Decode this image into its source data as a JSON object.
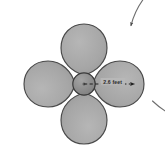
{
  "measurement": {
    "radius_label": "2.6 feet",
    "value": 2.6,
    "unit": "feet",
    "measured_from": "hub center",
    "measured_to": "blade tip"
  },
  "rotation": {
    "direction": "clockwise",
    "arc_arrow_name": "rotation-arc-arrow"
  },
  "geometry": {
    "center_x": 84,
    "center_y": 84,
    "hub_radius": 11,
    "blade_tip_radius": 52,
    "outer_arc_radius": 78,
    "blade_count": 4,
    "blade_angles_deg": [
      0,
      90,
      180,
      270
    ]
  },
  "colors": {
    "background": "#ffffff",
    "blade_fill": "#a8a8a8",
    "blade_stroke": "#4a4a4a",
    "hub_fill": "#8e8e8e",
    "hub_stroke": "#3a3a3a",
    "arc_stroke": "#6a6a6a",
    "dashed_line": "#1f1f1f",
    "label_text": "#2b2b2b"
  },
  "icons": {
    "arrowhead": "arrowhead-icon",
    "dashed_radius": "dashed-radius-line"
  }
}
